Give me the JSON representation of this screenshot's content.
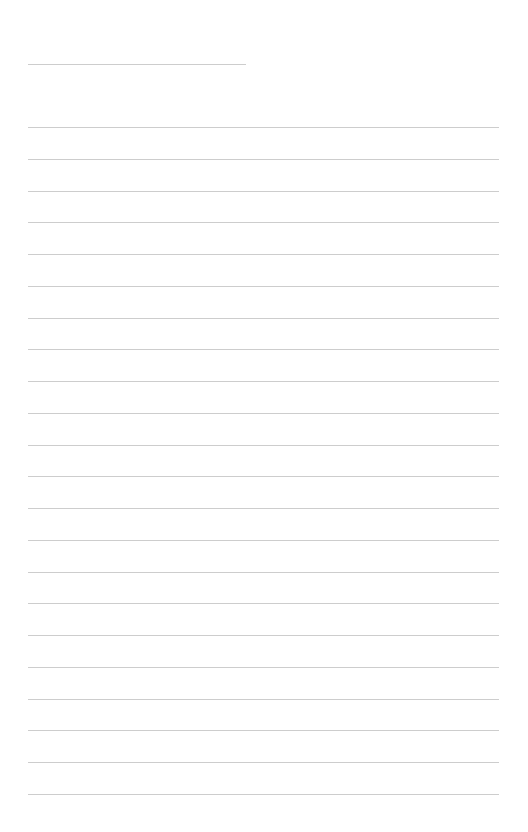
{
  "page": {
    "type": "lined-notepaper",
    "background_color": "#ffffff",
    "line_color": "#cdcdcd",
    "title_line": {
      "text": "",
      "x": 28,
      "y": 64,
      "width": 218
    },
    "ruled_lines": {
      "count": 22,
      "x": 28,
      "width": 471,
      "first_y": 127,
      "spacing": 31.75,
      "entries": [
        "",
        "",
        "",
        "",
        "",
        "",
        "",
        "",
        "",
        "",
        "",
        "",
        "",
        "",
        "",
        "",
        "",
        "",
        "",
        "",
        "",
        ""
      ]
    }
  }
}
